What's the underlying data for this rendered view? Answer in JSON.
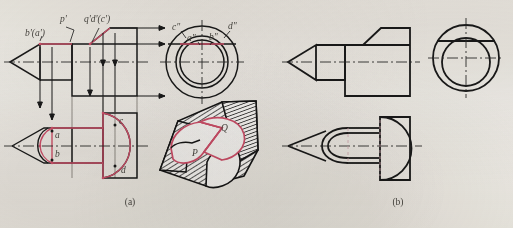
{
  "figure": {
    "captions": {
      "left": "(a)",
      "right": "(b)"
    },
    "colors": {
      "outline": "#1a1a1a",
      "highlight": "#d4526e",
      "centerline": "#2b2b2b",
      "paper": "#f2f0ec",
      "shading": "#2a2a2a"
    }
  },
  "part_a": {
    "name": "projection-analysis-with-labels",
    "front_view": {
      "labels": [
        {
          "id": "label-b-a-prime",
          "text": "b'(a')",
          "x": 25,
          "y": 34
        },
        {
          "id": "label-p-prime",
          "text": "p'",
          "x": 64,
          "y": 20
        },
        {
          "id": "label-q-d-c-prime",
          "text": "q'd'(c')",
          "x": 88,
          "y": 20
        }
      ]
    },
    "side_view": {
      "labels": [
        {
          "id": "label-c-double-prime",
          "text": "c\"",
          "x": 176,
          "y": 27
        },
        {
          "id": "label-d-double-prime",
          "text": "d\"",
          "x": 232,
          "y": 26
        },
        {
          "id": "label-a-double-prime",
          "text": "a\"",
          "x": 191,
          "y": 39
        },
        {
          "id": "label-b-double-prime",
          "text": "b\"",
          "x": 213,
          "y": 38
        }
      ]
    },
    "top_view": {
      "labels": [
        {
          "id": "label-a",
          "text": "a",
          "x": 57,
          "y": 135
        },
        {
          "id": "label-b",
          "text": "b",
          "x": 57,
          "y": 154
        },
        {
          "id": "label-c",
          "text": "c",
          "x": 120,
          "y": 126
        },
        {
          "id": "label-d",
          "text": "d",
          "x": 122,
          "y": 170
        }
      ]
    },
    "pictorial_view": {
      "labels": [
        {
          "id": "label-P",
          "text": "P",
          "x": 196,
          "y": 152
        },
        {
          "id": "label-Q",
          "text": "Q",
          "x": 224,
          "y": 127
        }
      ]
    }
  },
  "part_b": {
    "name": "finished-orthographic-views",
    "views": [
      "front-view",
      "side-view-circles",
      "top-view"
    ]
  }
}
